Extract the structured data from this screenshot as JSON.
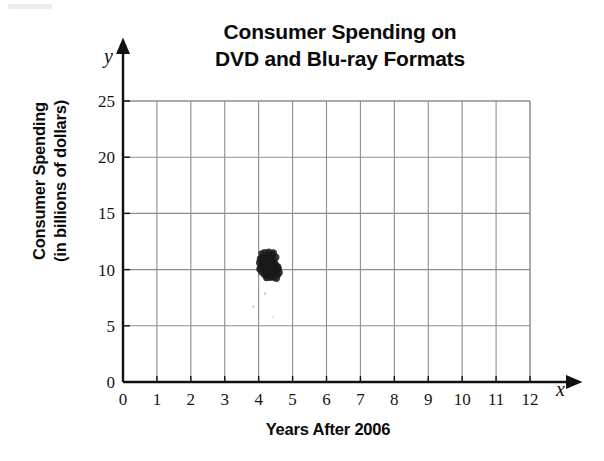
{
  "chart_data": {
    "type": "scatter",
    "title": "Consumer Spending on DVD and Blu-ray Formats",
    "title_lines": [
      "Consumer Spending on",
      "DVD and Blu-ray Formats"
    ],
    "xlabel": "Years After 2006",
    "ylabel": "Consumer Spending (in billions of dollars)",
    "ylabel_lines": [
      "Consumer Spending",
      "(in billions of dollars)"
    ],
    "x_axis_letter": "x",
    "y_axis_letter": "y",
    "xlim": [
      0,
      12
    ],
    "ylim": [
      0,
      25
    ],
    "xticks": [
      "0",
      "1",
      "2",
      "3",
      "4",
      "5",
      "6",
      "7",
      "8",
      "9",
      "10",
      "11",
      "12"
    ],
    "yticks": [
      "0",
      "5",
      "10",
      "15",
      "20",
      "25"
    ],
    "grid": true,
    "grid_x_step": 1,
    "grid_y_step": 5,
    "legend": null,
    "marker_color": "#1a1a1a",
    "series": [
      {
        "name": "Consumer Spending",
        "points": [
          [
            4.08,
            11.45
          ],
          [
            4.18,
            11.52
          ],
          [
            4.26,
            11.3
          ],
          [
            4.12,
            11.18
          ],
          [
            4.22,
            11.08
          ],
          [
            4.33,
            11.22
          ],
          [
            4.41,
            11.05
          ],
          [
            4.05,
            10.95
          ],
          [
            4.15,
            10.88
          ],
          [
            4.27,
            10.8
          ],
          [
            4.37,
            10.92
          ],
          [
            4.47,
            10.75
          ],
          [
            4.02,
            10.62
          ],
          [
            4.12,
            10.55
          ],
          [
            4.23,
            10.68
          ],
          [
            4.33,
            10.48
          ],
          [
            4.43,
            10.58
          ],
          [
            4.52,
            10.4
          ],
          [
            4.07,
            10.3
          ],
          [
            4.17,
            10.38
          ],
          [
            4.28,
            10.22
          ],
          [
            4.38,
            10.3
          ],
          [
            4.48,
            10.15
          ],
          [
            4.57,
            10.25
          ],
          [
            4.04,
            10.05
          ],
          [
            4.14,
            10.12
          ],
          [
            4.25,
            9.98
          ],
          [
            4.35,
            10.05
          ],
          [
            4.45,
            9.9
          ],
          [
            4.55,
            9.98
          ],
          [
            4.1,
            9.8
          ],
          [
            4.2,
            9.88
          ],
          [
            4.31,
            9.72
          ],
          [
            4.41,
            9.8
          ],
          [
            4.51,
            9.65
          ],
          [
            4.6,
            9.74
          ],
          [
            4.16,
            9.55
          ],
          [
            4.27,
            9.6
          ],
          [
            4.37,
            9.45
          ],
          [
            4.47,
            9.52
          ],
          [
            4.34,
            9.3
          ],
          [
            4.44,
            9.36
          ],
          [
            4.23,
            9.25
          ],
          [
            4.52,
            9.22
          ],
          [
            4.3,
            11.62
          ],
          [
            4.4,
            11.38
          ],
          [
            4.5,
            11.1
          ],
          [
            4.19,
            10.7
          ],
          [
            4.29,
            10.9
          ],
          [
            4.39,
            10.62
          ],
          [
            4.49,
            10.48
          ],
          [
            4.58,
            10.05
          ],
          [
            4.13,
            10.45
          ],
          [
            4.24,
            10.12
          ],
          [
            4.36,
            9.88
          ],
          [
            4.46,
            10.35
          ],
          [
            4.09,
            11.05
          ],
          [
            4.43,
            11.48
          ],
          [
            4.21,
            9.42
          ],
          [
            4.56,
            9.55
          ]
        ]
      }
    ],
    "cluster_note": "Single dense cluster of overlapping points near x = 4.3, y = 10.3"
  }
}
